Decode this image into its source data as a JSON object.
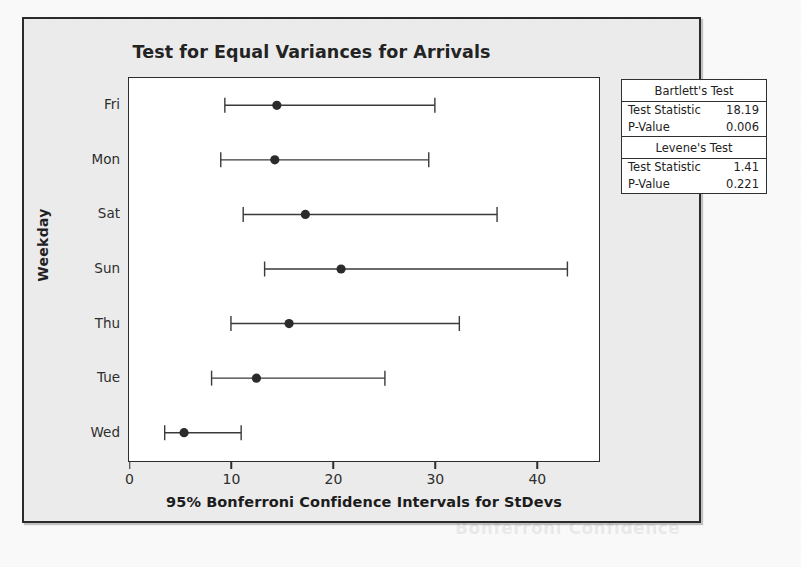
{
  "chart_data": {
    "type": "scatter",
    "title": "Test for Equal Variances for Arrivals",
    "xlabel": "95% Bonferroni Confidence Intervals for StDevs",
    "ylabel": "Weekday",
    "xlim": [
      0,
      46
    ],
    "xticks": [
      0,
      10,
      20,
      30,
      40
    ],
    "xtick_labels": [
      "0",
      "10",
      "20",
      "30",
      "40"
    ],
    "categories": [
      "Fri",
      "Mon",
      "Sat",
      "Sun",
      "Thu",
      "Tue",
      "Wed"
    ],
    "grid": false,
    "legend": null,
    "series": [
      {
        "name": "95% Bonferroni CI for StDev",
        "point_estimates": [
          14.5,
          14.3,
          17.3,
          20.8,
          15.7,
          12.5,
          5.4
        ],
        "lower": [
          9.4,
          9.0,
          11.2,
          13.3,
          10.0,
          8.1,
          3.5
        ],
        "upper": [
          30.0,
          29.4,
          36.1,
          43.0,
          32.4,
          25.1,
          11.0
        ]
      }
    ],
    "intervals": [
      {
        "category": "Fri",
        "lower": 9.4,
        "estimate": 14.5,
        "upper": 30.0
      },
      {
        "category": "Mon",
        "lower": 9.0,
        "estimate": 14.3,
        "upper": 29.4
      },
      {
        "category": "Sat",
        "lower": 11.2,
        "estimate": 17.3,
        "upper": 36.1
      },
      {
        "category": "Sun",
        "lower": 13.3,
        "estimate": 20.8,
        "upper": 43.0
      },
      {
        "category": "Thu",
        "lower": 10.0,
        "estimate": 15.7,
        "upper": 32.4
      },
      {
        "category": "Tue",
        "lower": 8.1,
        "estimate": 12.5,
        "upper": 25.1
      },
      {
        "category": "Wed",
        "lower": 3.5,
        "estimate": 5.4,
        "upper": 11.0
      }
    ],
    "annotations": {
      "bartlett_test": {
        "name": "Bartlett's Test",
        "test_statistic": "18.19",
        "p_value": "0.006"
      },
      "levene_test": {
        "name": "Levene's Test",
        "test_statistic": "1.41",
        "p_value": "0.221"
      }
    },
    "colors": {
      "marker": "#2b2b2b",
      "line": "#3a3a3a",
      "panel": "#ffffff",
      "figure": "#ebebeb"
    }
  },
  "stats_box": {
    "bartlett": {
      "heading": "Bartlett's Test",
      "statistic_label": "Test Statistic",
      "statistic_value": "18.19",
      "pvalue_label": "P-Value",
      "pvalue_value": "0.006"
    },
    "levene": {
      "heading": "Levene's Test",
      "statistic_label": "Test Statistic",
      "statistic_value": "1.41",
      "pvalue_label": "P-Value",
      "pvalue_value": "0.221"
    }
  },
  "ghost_text": {
    "line_a": "Weekday",
    "line_b": "Bonferroni Confidence"
  }
}
